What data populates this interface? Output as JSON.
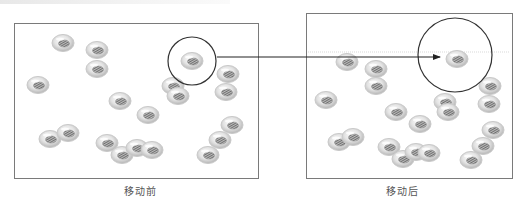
{
  "figure": {
    "type": "before-after cell movement diagram",
    "colors": {
      "panel_border": "#7a7a7a",
      "cell_outer": "#c9c9c9",
      "cell_inner": "#8c8c8c",
      "circle": "#333333",
      "arrow": "#222222",
      "guide_line": "#cfcfcf"
    }
  },
  "panels": [
    {
      "id": "before",
      "caption": "移动前",
      "box": {
        "x": 14,
        "y": 23,
        "w": 244,
        "h": 155
      },
      "highlight_circle": {
        "cx": 192,
        "cy": 61,
        "r": 24
      },
      "cells": [
        [
          63,
          43
        ],
        [
          97,
          50
        ],
        [
          97,
          69
        ],
        [
          38,
          85
        ],
        [
          120,
          101
        ],
        [
          148,
          115
        ],
        [
          173,
          86
        ],
        [
          178,
          96
        ],
        [
          228,
          74
        ],
        [
          226,
          92
        ],
        [
          192,
          61
        ],
        [
          50,
          139
        ],
        [
          68,
          133
        ],
        [
          107,
          143
        ],
        [
          122,
          155
        ],
        [
          137,
          148
        ],
        [
          152,
          150
        ],
        [
          232,
          125
        ],
        [
          220,
          140
        ],
        [
          208,
          155
        ]
      ]
    },
    {
      "id": "after",
      "caption": "移动后",
      "box": {
        "x": 306,
        "y": 13,
        "w": 206,
        "h": 165
      },
      "highlight_circle": {
        "cx": 455,
        "cy": 55,
        "r": 37
      },
      "guide_line_y": 52,
      "cells": [
        [
          347,
          62
        ],
        [
          376,
          69
        ],
        [
          376,
          86
        ],
        [
          326,
          100
        ],
        [
          396,
          112
        ],
        [
          420,
          124
        ],
        [
          445,
          102
        ],
        [
          448,
          112
        ],
        [
          490,
          86
        ],
        [
          489,
          104
        ],
        [
          457,
          59
        ],
        [
          339,
          142
        ],
        [
          353,
          137
        ],
        [
          389,
          147
        ],
        [
          403,
          159
        ],
        [
          416,
          152
        ],
        [
          429,
          153
        ],
        [
          493,
          130
        ],
        [
          483,
          146
        ],
        [
          471,
          160
        ]
      ]
    }
  ],
  "arrow": {
    "x1": 217,
    "y1": 57,
    "x2": 440,
    "y2": 57
  }
}
